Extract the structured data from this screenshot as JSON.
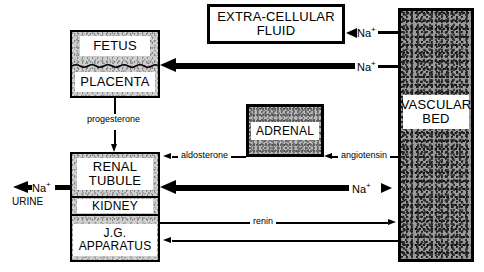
{
  "diagram": {
    "boxes": {
      "fetus": {
        "label": "FETUS"
      },
      "placenta": {
        "label": "PLACENTA"
      },
      "extracellular_fluid": {
        "label": "EXTRA-CELLULAR\nFLUID"
      },
      "vascular_bed": {
        "label": "VASCULAR\nBED"
      },
      "adrenal": {
        "label": "ADRENAL"
      },
      "renal_tubule": {
        "label": "RENAL\nTUBULE"
      },
      "kidney": {
        "label": "KIDNEY"
      },
      "jg_apparatus": {
        "label": "J.G.\nAPPARATUS"
      }
    },
    "ion_labels": {
      "na_to_ecf": "Na",
      "na_to_ecf_charge": "+",
      "na_to_placenta": "Na",
      "na_to_placenta_charge": "+",
      "na_tubule_vascular": "Na",
      "na_tubule_vascular_charge": "+",
      "na_urine": "Na",
      "na_urine_charge": "+"
    },
    "mediators": {
      "progesterone": "progesterone",
      "aldosterone": "aldosterone",
      "angiotensin": "angiotensin",
      "renin": "renin"
    },
    "endpoints": {
      "urine": "URINE"
    },
    "colors": {
      "ink": "#000000",
      "paper": "#ffffff",
      "fill_light": "#cfcfcf",
      "fill_mid": "#b9b9b9",
      "fill_dark": "#9a9a9a"
    }
  }
}
